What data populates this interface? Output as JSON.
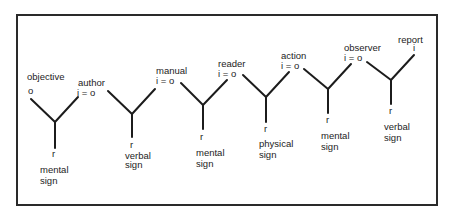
{
  "diagram": {
    "title": "",
    "style": {
      "line_color": "#1c1c1c",
      "frame_color": "#2a2a2a",
      "background": "#ffffff"
    },
    "nodes": [
      {
        "id": "y1",
        "top_left_label": "objective",
        "top_left_symbol": "o",
        "top_right_label": "",
        "top_right_symbol": "",
        "bottom_symbol": "r",
        "sign_line1": "mental",
        "sign_line2": "sign"
      },
      {
        "id": "y2",
        "top_left_label": "author",
        "top_left_symbol": "i = o",
        "bottom_symbol": "r",
        "sign_line1": "verbal",
        "sign_line2": "sign"
      },
      {
        "id": "y3",
        "top_left_label": "manual",
        "top_left_symbol": "i = o",
        "bottom_symbol": "r",
        "sign_line1": "mental",
        "sign_line2": "sign"
      },
      {
        "id": "y4",
        "top_left_label": "reader",
        "top_left_symbol": "i = o",
        "bottom_symbol": "r",
        "sign_line1": "physical",
        "sign_line2": "sign"
      },
      {
        "id": "y5",
        "top_left_label": "action",
        "top_left_symbol": "i = o",
        "bottom_symbol": "r",
        "sign_line1": "mental",
        "sign_line2": "sign"
      },
      {
        "id": "y6",
        "top_left_label": "observer",
        "top_left_symbol": "i = o",
        "top_right_label": "report",
        "top_right_symbol": "i",
        "bottom_symbol": "r",
        "sign_line1": "verbal",
        "sign_line2": "sign"
      }
    ]
  }
}
